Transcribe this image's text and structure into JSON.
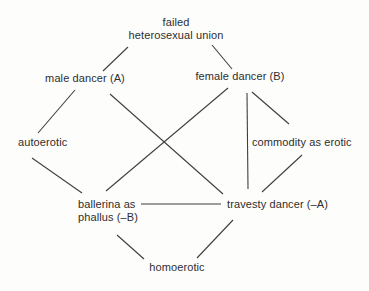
{
  "diagram": {
    "colors": {
      "background": "#fdfdfc",
      "text": "#2e2e2e",
      "line": "#3f3f3f"
    },
    "nodes": {
      "failed_union": {
        "line1": "failed",
        "line2": "heterosexual union"
      },
      "male_dancer": {
        "label": "male dancer (A)"
      },
      "female_dancer": {
        "label": "female dancer (B)"
      },
      "autoerotic": {
        "label": "autoerotic"
      },
      "commodity": {
        "label": "commodity as erotic"
      },
      "ballerina": {
        "line1": "ballerina as",
        "line2": "phallus (–B)"
      },
      "travesty": {
        "label": "travesty dancer (–A)"
      },
      "homoerotic": {
        "label": "homoerotic"
      }
    },
    "edges": [
      {
        "from": "failed-union",
        "to": "male-dancer",
        "x1": 128,
        "y1": 47,
        "x2": 103,
        "y2": 71
      },
      {
        "from": "failed-union",
        "to": "female-dancer",
        "x1": 212,
        "y1": 45,
        "x2": 232,
        "y2": 69
      },
      {
        "from": "male-dancer",
        "to": "autoerotic",
        "x1": 75,
        "y1": 90,
        "x2": 38,
        "y2": 133
      },
      {
        "from": "male-dancer",
        "to": "travesty",
        "x1": 110,
        "y1": 94,
        "x2": 223,
        "y2": 194
      },
      {
        "from": "female-dancer",
        "to": "ballerina",
        "x1": 228,
        "y1": 88,
        "x2": 106,
        "y2": 191
      },
      {
        "from": "female-dancer",
        "to": "commodity",
        "x1": 252,
        "y1": 92,
        "x2": 289,
        "y2": 124
      },
      {
        "from": "female-dancer",
        "to": "travesty",
        "x1": 247,
        "y1": 93,
        "x2": 248,
        "y2": 189
      },
      {
        "from": "autoerotic",
        "to": "ballerina",
        "x1": 32,
        "y1": 158,
        "x2": 82,
        "y2": 193
      },
      {
        "from": "commodity",
        "to": "travesty",
        "x1": 302,
        "y1": 155,
        "x2": 262,
        "y2": 192
      },
      {
        "from": "ballerina",
        "to": "travesty",
        "x1": 141,
        "y1": 204,
        "x2": 221,
        "y2": 204
      },
      {
        "from": "ballerina",
        "to": "homoerotic",
        "x1": 117,
        "y1": 235,
        "x2": 144,
        "y2": 259
      },
      {
        "from": "travesty",
        "to": "homoerotic",
        "x1": 233,
        "y1": 220,
        "x2": 197,
        "y2": 258
      }
    ]
  }
}
